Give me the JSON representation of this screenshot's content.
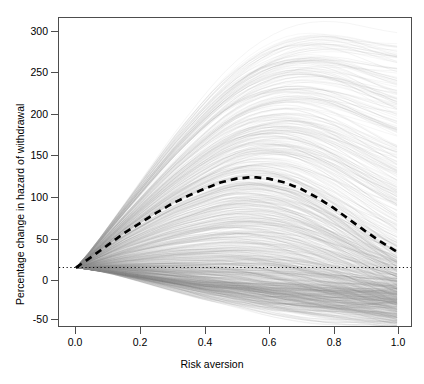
{
  "chart_data": {
    "type": "line",
    "title": "",
    "xlabel": "Risk aversion",
    "ylabel": "Percentage change in hazard of withdrawal",
    "xlim": [
      0.0,
      1.0
    ],
    "ylim": [
      -75,
      320
    ],
    "xticks": [
      0.0,
      0.2,
      0.4,
      0.6,
      0.8,
      1.0
    ],
    "xticklabels": [
      "0.0",
      "0.2",
      "0.4",
      "0.6",
      "0.8",
      "1.0"
    ],
    "yticks": [
      -50,
      0,
      50,
      100,
      150,
      200,
      250,
      300
    ],
    "yticklabels": [
      "-50",
      "0",
      "50",
      "100",
      "150",
      "200",
      "250",
      "300"
    ],
    "grid": false,
    "legend": null,
    "x": [
      0.0,
      0.05,
      0.1,
      0.15,
      0.2,
      0.25,
      0.3,
      0.35,
      0.4,
      0.45,
      0.5,
      0.55,
      0.6,
      0.65,
      0.7,
      0.75,
      0.8,
      0.85,
      0.9,
      0.95,
      1.0
    ],
    "series": [
      {
        "name": "median",
        "style": "dashed",
        "color": "#000000",
        "values": [
          0,
          14,
          29,
          44,
          57,
          70,
          82,
          92,
          101,
          109,
          114,
          116,
          114,
          109,
          101,
          90,
          77,
          62,
          47,
          33,
          20
        ]
      },
      {
        "name": "zero-reference",
        "style": "dotted",
        "color": "#000000",
        "values": [
          0,
          0,
          0,
          0,
          0,
          0,
          0,
          0,
          0,
          0,
          0,
          0,
          0,
          0,
          0,
          0,
          0,
          0,
          0,
          0,
          0
        ]
      },
      {
        "name": "bootstrap-envelope-upper",
        "style": "faint",
        "color": "#bdbdbd",
        "values": [
          0,
          24,
          52,
          80,
          108,
          136,
          163,
          188,
          212,
          234,
          252,
          268,
          280,
          289,
          295,
          298,
          298,
          296,
          292,
          288,
          285
        ]
      },
      {
        "name": "bootstrap-envelope-lower",
        "style": "faint",
        "color": "#bdbdbd",
        "values": [
          0,
          -3,
          -6,
          -10,
          -14,
          -18,
          -22,
          -26,
          -30,
          -33,
          -36,
          -39,
          -42,
          -44,
          -46,
          -48,
          -49,
          -50,
          -51,
          -52,
          -53
        ]
      }
    ],
    "n_bootstrap_curves": 900,
    "annotations": [
      {
        "text": "dense dark convergence at origin",
        "x": 0.0,
        "y": 0
      }
    ]
  },
  "axis": {
    "yticklabels": [
      "300",
      "250",
      "200",
      "150",
      "100",
      "50",
      "0",
      "-50"
    ],
    "xticklabels": [
      "0.0",
      "0.2",
      "0.4",
      "0.6",
      "0.8",
      "1.0"
    ],
    "ylabel": "Percentage change in hazard of withdrawal",
    "xlabel": "Risk aversion"
  },
  "caption": {
    "text": ""
  }
}
